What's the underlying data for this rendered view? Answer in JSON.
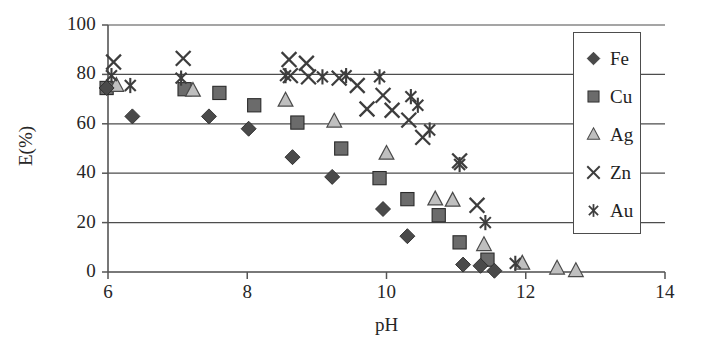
{
  "chart_data": {
    "type": "scatter",
    "title": "",
    "xlabel": "pH",
    "ylabel": "E(%)",
    "xlim": [
      6,
      14
    ],
    "ylim": [
      0,
      100
    ],
    "xticks": [
      6,
      8,
      10,
      12,
      14
    ],
    "yticks": [
      0,
      20,
      40,
      60,
      80,
      100
    ],
    "xtick_labels": [
      "6",
      "8",
      "10",
      "12",
      "14"
    ],
    "ytick_labels": [
      "0",
      "20",
      "40",
      "60",
      "80",
      "100"
    ],
    "grid": "horizontal",
    "legend_position": "top-right",
    "series": [
      {
        "name": "Fe",
        "marker": "filled-diamond",
        "color": "#4a4a4a",
        "points": [
          {
            "x": 5.98,
            "y": 74.5
          },
          {
            "x": 6.35,
            "y": 63.0
          },
          {
            "x": 7.45,
            "y": 63.0
          },
          {
            "x": 8.02,
            "y": 58.0
          },
          {
            "x": 8.65,
            "y": 46.5
          },
          {
            "x": 9.22,
            "y": 38.5
          },
          {
            "x": 9.95,
            "y": 25.5
          },
          {
            "x": 10.3,
            "y": 14.5
          },
          {
            "x": 11.1,
            "y": 3.0
          },
          {
            "x": 11.35,
            "y": 2.5
          },
          {
            "x": 11.55,
            "y": 0.5
          }
        ]
      },
      {
        "name": "Cu",
        "marker": "filled-square",
        "color": "#6b6b6b",
        "points": [
          {
            "x": 5.98,
            "y": 74.5
          },
          {
            "x": 7.1,
            "y": 74.0
          },
          {
            "x": 7.6,
            "y": 72.5
          },
          {
            "x": 8.1,
            "y": 67.5
          },
          {
            "x": 8.72,
            "y": 60.5
          },
          {
            "x": 9.35,
            "y": 50.0
          },
          {
            "x": 9.9,
            "y": 38.0
          },
          {
            "x": 10.3,
            "y": 29.5
          },
          {
            "x": 10.75,
            "y": 23.0
          },
          {
            "x": 11.05,
            "y": 12.0
          },
          {
            "x": 11.45,
            "y": 5.0
          }
        ]
      },
      {
        "name": "Ag",
        "marker": "open-triangle",
        "color": "#bfbfbf",
        "points": [
          {
            "x": 6.12,
            "y": 75.5
          },
          {
            "x": 7.22,
            "y": 73.5
          },
          {
            "x": 8.55,
            "y": 69.5
          },
          {
            "x": 9.25,
            "y": 61.0
          },
          {
            "x": 10.0,
            "y": 48.0
          },
          {
            "x": 10.7,
            "y": 29.5
          },
          {
            "x": 10.95,
            "y": 29.0
          },
          {
            "x": 11.4,
            "y": 11.0
          },
          {
            "x": 11.95,
            "y": 3.5
          },
          {
            "x": 12.45,
            "y": 1.5
          },
          {
            "x": 12.72,
            "y": 0.5
          }
        ]
      },
      {
        "name": "Zn",
        "marker": "cross-x",
        "color": "#3d3d3d",
        "points": [
          {
            "x": 6.08,
            "y": 85.0
          },
          {
            "x": 7.08,
            "y": 86.5
          },
          {
            "x": 8.6,
            "y": 86.0
          },
          {
            "x": 8.85,
            "y": 84.5
          },
          {
            "x": 8.62,
            "y": 79.5
          },
          {
            "x": 8.88,
            "y": 79.0
          },
          {
            "x": 9.32,
            "y": 78.5
          },
          {
            "x": 9.58,
            "y": 75.5
          },
          {
            "x": 9.95,
            "y": 71.5
          },
          {
            "x": 9.72,
            "y": 66.0
          },
          {
            "x": 10.08,
            "y": 65.5
          },
          {
            "x": 10.32,
            "y": 61.5
          },
          {
            "x": 10.52,
            "y": 54.5
          },
          {
            "x": 11.05,
            "y": 45.0
          },
          {
            "x": 11.3,
            "y": 27.0
          }
        ]
      },
      {
        "name": "Au",
        "marker": "asterisk",
        "color": "#3d3d3d",
        "points": [
          {
            "x": 6.05,
            "y": 79.5
          },
          {
            "x": 6.32,
            "y": 75.5
          },
          {
            "x": 7.05,
            "y": 78.5
          },
          {
            "x": 8.55,
            "y": 79.5
          },
          {
            "x": 9.08,
            "y": 79.0
          },
          {
            "x": 9.42,
            "y": 79.5
          },
          {
            "x": 9.9,
            "y": 79.0
          },
          {
            "x": 10.35,
            "y": 71.0
          },
          {
            "x": 10.45,
            "y": 67.5
          },
          {
            "x": 10.62,
            "y": 57.5
          },
          {
            "x": 11.05,
            "y": 43.5
          },
          {
            "x": 11.42,
            "y": 20.0
          },
          {
            "x": 11.85,
            "y": 3.5
          }
        ]
      }
    ]
  },
  "legend": {
    "entries": [
      {
        "label": "Fe",
        "marker": "filled-diamond"
      },
      {
        "label": "Cu",
        "marker": "filled-square"
      },
      {
        "label": "Ag",
        "marker": "open-triangle"
      },
      {
        "label": "Zn",
        "marker": "cross-x"
      },
      {
        "label": "Au",
        "marker": "asterisk"
      }
    ]
  },
  "colors": {
    "axis": "#555555",
    "grid": "#4d4d4d",
    "text": "#262626",
    "fe": "#4a4a4a",
    "cu": "#6b6b6b",
    "ag": "#bfbfbf",
    "zn": "#3d3d3d",
    "au": "#3d3d3d"
  }
}
